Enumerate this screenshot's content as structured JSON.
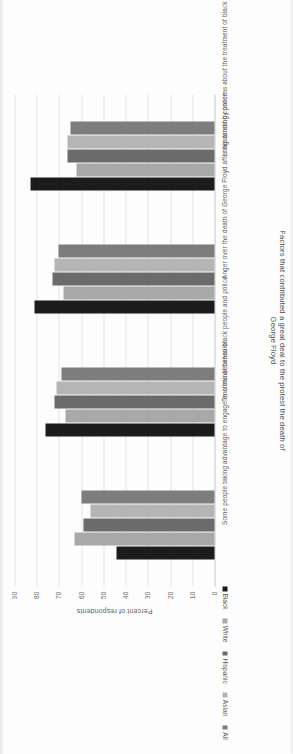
{
  "chart_data": {
    "type": "bar",
    "title": "",
    "xlabel": "Factors that contributed a great deal to the protest the death of George Floyd",
    "ylabel": "Percent of respondents",
    "ylim": [
      0,
      90
    ],
    "yticks": [
      0,
      10,
      20,
      30,
      40,
      50,
      60,
      70,
      80,
      90
    ],
    "grid": true,
    "legend_position": "bottom-left",
    "categories": [
      "Some people taking advantage to engage in criminal behavior",
      "Tensions between black people and police",
      "Anger over the death of George Floyd after his arrest by police",
      "Longstanding concerns about the treatment of black people in the country"
    ],
    "series": [
      {
        "name": "Black",
        "color": "#1c1c1c",
        "values": [
          44,
          76,
          81,
          83
        ]
      },
      {
        "name": "White",
        "color": "#a8a8a8",
        "values": [
          63,
          67,
          68,
          62
        ]
      },
      {
        "name": "Hispanic",
        "color": "#6b6b6b",
        "values": [
          59,
          72,
          73,
          66
        ]
      },
      {
        "name": "Asian",
        "color": "#b5b5b5",
        "values": [
          56,
          71,
          72,
          66
        ]
      },
      {
        "name": "All",
        "color": "#7d7d7d",
        "values": [
          60,
          69,
          70,
          65
        ]
      }
    ]
  },
  "axis": {
    "y_title": "Percent of respondents",
    "x_title_line1": "Factors that contributed a great deal to the protest the death of",
    "x_title_line2": "George Floyd"
  },
  "legend": {
    "items": [
      {
        "label": "Black"
      },
      {
        "label": "White"
      },
      {
        "label": "Hispanic"
      },
      {
        "label": "Asian"
      },
      {
        "label": "All"
      }
    ]
  }
}
